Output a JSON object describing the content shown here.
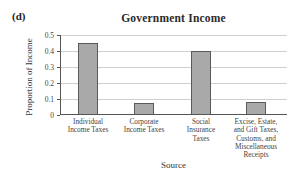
{
  "panel_label": "(d)",
  "chart_data": {
    "type": "bar",
    "title": "Government Income",
    "xlabel": "Source",
    "ylabel": "Proportion of Income",
    "categories": [
      "Individual Income Taxes",
      "Corporate Income Taxes",
      "Social Insurance Taxes",
      "Excise, Estate, and Gift Taxes, Customs, and Miscellaneous Receipts"
    ],
    "values": [
      0.45,
      0.075,
      0.4,
      0.08
    ],
    "ylim": [
      0,
      0.5
    ],
    "yticks": [
      "0",
      "0.1",
      "0.2",
      "0.3",
      "0.4",
      "0.5"
    ],
    "grid": true,
    "legend": null,
    "bar_color": "#a9a9a9",
    "bar_edge_color": "#5a5a5a"
  },
  "labels": {
    "title": "Government Income",
    "xlabel": "Source",
    "ylabel": "Proportion of Income",
    "yticks": [
      "0.5",
      "0.4",
      "0.3",
      "0.2",
      "0.1",
      "0"
    ],
    "categories": [
      "Individual\nIncome Taxes",
      "Corporate\nIncome Taxes",
      "Social\nInsurance\nTaxes",
      "Excise, Estate,\nand Gift Taxes,\nCustoms, and\nMiscellaneous\nReceipts"
    ]
  }
}
